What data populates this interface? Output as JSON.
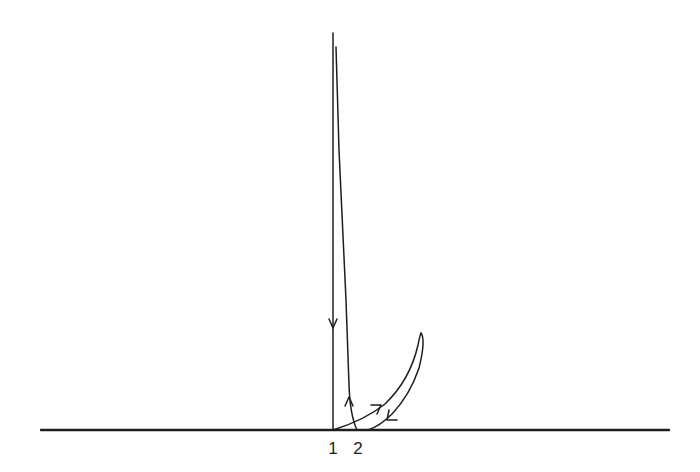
{
  "diagram": {
    "type": "trajectory-sketch",
    "colors": {
      "background": "#ffffff",
      "ink": "#1e1e1e"
    },
    "axis": {
      "orientation": "horizontal",
      "y": 430,
      "x_start": 41,
      "x_end": 669
    },
    "labels": [
      {
        "id": "point-1",
        "text": "1",
        "x": 333,
        "y": 440
      },
      {
        "id": "point-2",
        "text": "2",
        "x": 358,
        "y": 440
      }
    ],
    "paths": [
      {
        "id": "descending-line",
        "description": "Vertical line descending from top to point 1",
        "direction": "down",
        "arrow": {
          "x": 333,
          "y": 327,
          "heading": "down"
        }
      },
      {
        "id": "ascending-line",
        "description": "Nearly vertical line rising from point 2 to the top",
        "direction": "up",
        "arrow": {
          "x": 349,
          "y": 401,
          "heading": "up"
        }
      },
      {
        "id": "loop-outbound",
        "description": "Curve leaving point 1 rising toward loop tip",
        "direction": "up-right",
        "arrow": {
          "x": 378,
          "y": 408,
          "heading": "up-right"
        }
      },
      {
        "id": "loop-return",
        "description": "Curve returning from loop tip down to baseline",
        "direction": "down-left",
        "arrow": {
          "x": 390,
          "y": 418,
          "heading": "down-left"
        }
      }
    ]
  }
}
